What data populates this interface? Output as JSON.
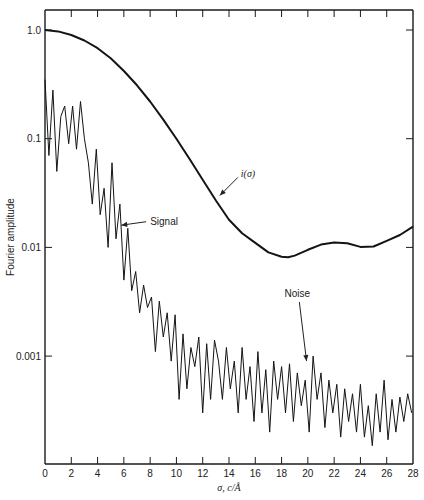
{
  "chart_data": {
    "type": "line",
    "title": "",
    "xlabel": "σ, c/Å",
    "ylabel": "Fourier amplitude",
    "yscale": "log",
    "xlim": [
      0,
      28
    ],
    "ylim": [
      0.00012,
      1.7
    ],
    "grid": false,
    "legend": null,
    "x_ticks": [
      0,
      2,
      4,
      6,
      8,
      10,
      12,
      14,
      16,
      18,
      20,
      22,
      24,
      26,
      28
    ],
    "x_tick_labels": [
      "0",
      "2",
      "4",
      "6",
      "8",
      "10",
      "12",
      "14",
      "16",
      "18",
      "20",
      "22",
      "24",
      "26",
      "28"
    ],
    "y_ticks": [
      1.0,
      0.1,
      0.01,
      0.001
    ],
    "y_tick_labels": [
      "1.0",
      "0.1",
      "0.01",
      "0.001"
    ],
    "series": [
      {
        "name": "i(σ)",
        "style": "thick-smooth",
        "x": [
          0,
          1,
          2,
          3,
          4,
          5,
          6,
          7,
          8,
          9,
          10,
          11,
          12,
          13,
          14,
          15,
          16,
          17,
          18,
          18.5,
          19,
          20,
          21,
          22,
          23,
          24,
          25,
          26,
          27,
          28
        ],
        "y": [
          1.0,
          0.97,
          0.9,
          0.8,
          0.68,
          0.55,
          0.42,
          0.31,
          0.22,
          0.15,
          0.1,
          0.065,
          0.042,
          0.027,
          0.018,
          0.0135,
          0.011,
          0.009,
          0.0082,
          0.0081,
          0.0084,
          0.0095,
          0.0106,
          0.0111,
          0.0109,
          0.0101,
          0.0102,
          0.0115,
          0.013,
          0.0155
        ]
      },
      {
        "name": "Signal / Noise",
        "style": "thin-noisy",
        "x": [
          0,
          0.3,
          0.6,
          0.9,
          1.2,
          1.5,
          1.8,
          2.1,
          2.4,
          2.7,
          3.0,
          3.3,
          3.6,
          3.9,
          4.2,
          4.5,
          4.8,
          5.1,
          5.4,
          5.7,
          6.0,
          6.3,
          6.6,
          6.9,
          7.2,
          7.5,
          7.8,
          8.1,
          8.4,
          8.7,
          9.0,
          9.3,
          9.6,
          9.9,
          10.2,
          10.5,
          10.8,
          11.1,
          11.4,
          11.7,
          12.0,
          12.3,
          12.6,
          12.9,
          13.2,
          13.5,
          13.8,
          14.1,
          14.4,
          14.7,
          15.0,
          15.3,
          15.6,
          15.9,
          16.2,
          16.5,
          16.8,
          17.1,
          17.4,
          17.7,
          18.0,
          18.3,
          18.6,
          18.9,
          19.2,
          19.5,
          19.8,
          20.1,
          20.4,
          20.7,
          21.0,
          21.3,
          21.6,
          21.9,
          22.2,
          22.5,
          22.8,
          23.1,
          23.4,
          23.7,
          24.0,
          24.3,
          24.6,
          24.9,
          25.2,
          25.5,
          25.8,
          26.1,
          26.4,
          26.7,
          27.0,
          27.3,
          27.6,
          27.9
        ],
        "y": [
          0.35,
          0.07,
          0.28,
          0.05,
          0.16,
          0.2,
          0.09,
          0.2,
          0.08,
          0.22,
          0.1,
          0.06,
          0.025,
          0.08,
          0.02,
          0.035,
          0.01,
          0.06,
          0.012,
          0.025,
          0.005,
          0.015,
          0.004,
          0.006,
          0.0025,
          0.0045,
          0.0028,
          0.0035,
          0.0011,
          0.0032,
          0.0015,
          0.0025,
          0.0009,
          0.0024,
          0.0004,
          0.0016,
          0.0005,
          0.0012,
          0.0008,
          0.0015,
          0.0003,
          0.0013,
          0.0004,
          0.0014,
          0.0009,
          0.0004,
          0.0012,
          0.0005,
          0.0009,
          0.0003,
          0.0012,
          0.0004,
          0.0008,
          0.00025,
          0.0011,
          0.0003,
          0.00075,
          0.0002,
          0.0009,
          0.0004,
          0.0008,
          0.0003,
          0.00085,
          0.00025,
          0.0007,
          0.00035,
          0.0006,
          0.0002,
          0.001,
          0.0004,
          0.0007,
          0.00022,
          0.0006,
          0.0003,
          0.00055,
          0.00018,
          0.0005,
          0.00025,
          0.00045,
          0.0002,
          0.00055,
          0.00018,
          0.00035,
          0.00015,
          0.00045,
          0.0002,
          0.0006,
          0.00017,
          0.0004,
          0.0002,
          0.00042,
          0.00025,
          0.00045,
          0.0003
        ]
      }
    ],
    "annotations": [
      {
        "text": "i(σ)",
        "x": 14.9,
        "y": 0.044,
        "arrow_to": [
          13.3,
          0.03
        ]
      },
      {
        "text": "Signal",
        "x": 8.0,
        "y": 0.016,
        "arrow_to": [
          5.8,
          0.016
        ]
      },
      {
        "text": "Noise",
        "x": 19.2,
        "y": 0.0035,
        "arrow_to": [
          19.9,
          0.0009
        ]
      }
    ]
  }
}
